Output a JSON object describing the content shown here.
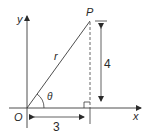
{
  "diagram": {
    "type": "polar-coordinate-triangle",
    "colors": {
      "line": "#3a3a3a",
      "background": "#ffffff"
    },
    "labels": {
      "y_axis": "y",
      "x_axis": "x",
      "origin": "O",
      "point": "P",
      "hypotenuse": "r",
      "angle": "θ",
      "vertical_length": "4",
      "horizontal_length": "3"
    }
  }
}
